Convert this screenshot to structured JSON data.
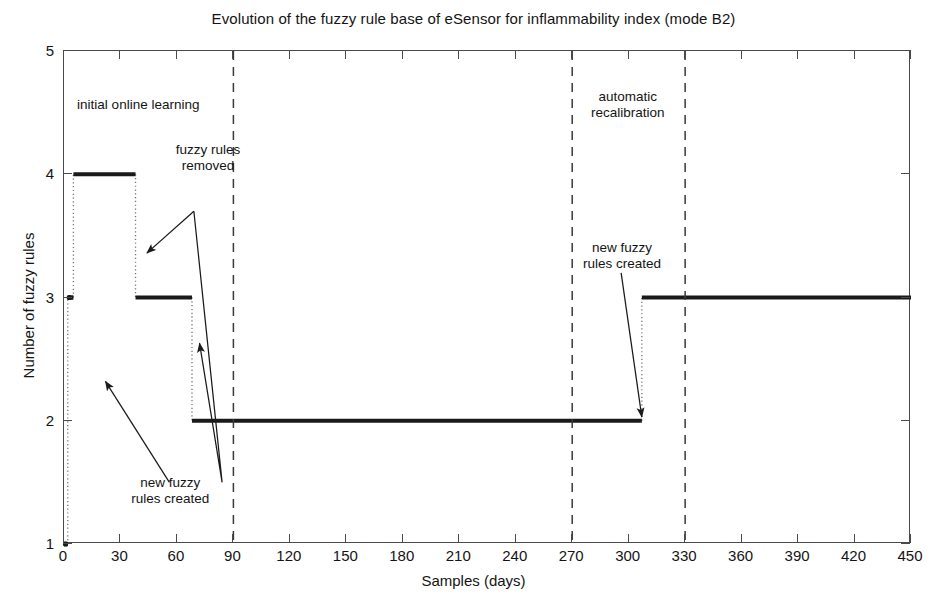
{
  "chart_data": {
    "type": "line",
    "title": "Evolution of the fuzzy rule base of eSensor for inflammability index (mode B2)",
    "xlabel": "Samples (days)",
    "ylabel": "Number of fuzzy rules",
    "xlim": [
      0,
      450
    ],
    "ylim": [
      1,
      5
    ],
    "xticks": [
      0,
      30,
      60,
      90,
      120,
      150,
      180,
      210,
      240,
      270,
      300,
      330,
      360,
      390,
      420,
      450
    ],
    "yticks": [
      1,
      2,
      3,
      4,
      5
    ],
    "grid": false,
    "legend": "none",
    "series": [
      {
        "name": "Number of fuzzy rules",
        "style": "step-post",
        "marker": "dot",
        "color": "#1a1a1a",
        "x": [
          0,
          2,
          5,
          38,
          68,
          307,
          450
        ],
        "y": [
          1,
          3,
          4,
          3,
          2,
          3,
          3
        ],
        "steps": [
          {
            "x_start": 0,
            "x_end": 2,
            "value": 1
          },
          {
            "x_start": 2,
            "x_end": 5,
            "value": 3
          },
          {
            "x_start": 5,
            "x_end": 38,
            "value": 4
          },
          {
            "x_start": 38,
            "x_end": 68,
            "value": 3
          },
          {
            "x_start": 68,
            "x_end": 307,
            "value": 2
          },
          {
            "x_start": 307,
            "x_end": 450,
            "value": 3
          }
        ]
      }
    ],
    "vertical_lines": [
      {
        "x": 90,
        "style": "dashed",
        "color": "#3a3a3a"
      },
      {
        "x": 270,
        "style": "dashed",
        "color": "#3a3a3a"
      },
      {
        "x": 330,
        "style": "dashed",
        "color": "#3a3a3a"
      }
    ],
    "annotations": [
      {
        "id": "initial-online-learning",
        "text": "initial online learning",
        "x": 40,
        "y": 4.55,
        "arrow": false
      },
      {
        "id": "fuzzy-rules-removed",
        "text": "fuzzy rules\nremoved",
        "x": 77,
        "y": 4.12,
        "arrow": true
      },
      {
        "id": "new-fuzzy-rules-created-left",
        "text": "new fuzzy\nrules created",
        "x": 57,
        "y": 1.42,
        "arrow": true
      },
      {
        "id": "automatic-recalibration",
        "text": "automatic\nrecalibration",
        "x": 300,
        "y": 4.55,
        "arrow": false
      },
      {
        "id": "new-fuzzy-rules-created-right",
        "text": "new fuzzy\nrules created",
        "x": 297,
        "y": 3.33,
        "arrow": true
      }
    ]
  },
  "axis": {
    "x_tick_labels": [
      "0",
      "30",
      "60",
      "90",
      "120",
      "150",
      "180",
      "210",
      "240",
      "270",
      "300",
      "330",
      "360",
      "390",
      "420",
      "450"
    ],
    "y_tick_labels": [
      "1",
      "2",
      "3",
      "4",
      "5"
    ]
  },
  "annotation_text": {
    "initial_online_learning": "initial online learning",
    "fuzzy_rules_removed_line1": "fuzzy rules",
    "fuzzy_rules_removed_line2": "removed",
    "new_rules_left_line1": "new fuzzy",
    "new_rules_left_line2": "rules created",
    "automatic_recalibration_line1": "automatic",
    "automatic_recalibration_line2": "recalibration",
    "new_rules_right_line1": "new fuzzy",
    "new_rules_right_line2": "rules created"
  }
}
